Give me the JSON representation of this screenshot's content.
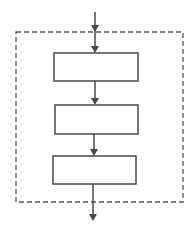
{
  "diagram": {
    "type": "flowchart",
    "colors": {
      "stroke": "#4a4a4a",
      "dashed_border": "#555555",
      "background": "#ffffff"
    },
    "boundary": {
      "style": "dashed",
      "x": 16,
      "y": 32,
      "width": 167,
      "height": 170
    },
    "boxes": [
      {
        "id": "box-1",
        "label": "",
        "x": 54,
        "y": 53,
        "width": 84,
        "height": 28
      },
      {
        "id": "box-2",
        "label": "",
        "x": 55,
        "y": 105,
        "width": 83,
        "height": 29
      },
      {
        "id": "box-3",
        "label": "",
        "x": 53,
        "y": 156,
        "width": 83,
        "height": 28
      }
    ],
    "arrows": [
      {
        "id": "input-arrow",
        "from": "outside-top",
        "to": "box-1"
      },
      {
        "id": "arrow-1-2",
        "from": "box-1",
        "to": "box-2"
      },
      {
        "id": "arrow-2-3",
        "from": "box-2",
        "to": "box-3"
      },
      {
        "id": "output-arrow",
        "from": "box-3",
        "to": "outside-bottom"
      }
    ]
  }
}
